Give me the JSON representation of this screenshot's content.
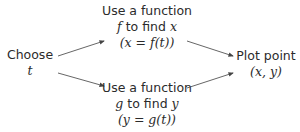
{
  "nodes": {
    "choose": {
      "line1": "Choose",
      "line2": "t"
    },
    "top": {
      "line1": "Use a function",
      "line2_var": "f",
      "line2_text": " to find ",
      "line2_target": "x",
      "line3": "(x = f(t))"
    },
    "bottom": {
      "line1": "Use a function",
      "line2_var": "g",
      "line2_text": " to find ",
      "line2_target": "y",
      "line3": "(y = g(t))"
    },
    "plot": {
      "line1": "Plot point",
      "line2": "(x, y)"
    }
  },
  "edges": [
    {
      "from": "choose",
      "to": "top"
    },
    {
      "from": "choose",
      "to": "bottom"
    },
    {
      "from": "top",
      "to": "plot"
    },
    {
      "from": "bottom",
      "to": "plot"
    }
  ],
  "colors": {
    "text": "#2b2b2b",
    "arrow": "#444444",
    "background": "#ffffff"
  }
}
